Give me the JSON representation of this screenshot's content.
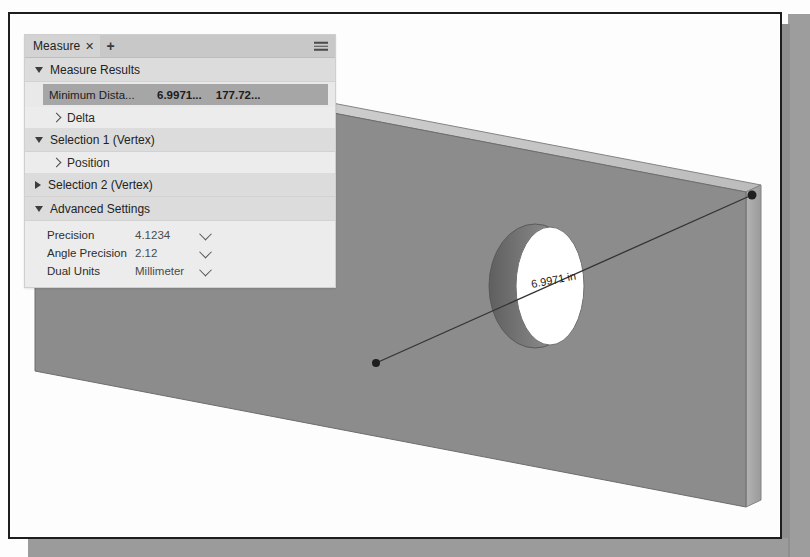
{
  "window": {
    "title": "Measure"
  },
  "panel": {
    "tab": {
      "label": "Measure",
      "close_glyph": "✕",
      "add_glyph": "+",
      "menu_icon": "hamburger-menu-icon"
    },
    "sections": [
      {
        "id": "measure-results",
        "label": "Measure Results",
        "expanded": true,
        "state_glyph": "▼"
      },
      {
        "id": "selection-1",
        "label": "Selection 1 (Vertex)",
        "expanded": true,
        "state_glyph": "▼"
      },
      {
        "id": "selection-2",
        "label": "Selection 2 (Vertex)",
        "expanded": false,
        "state_glyph": "▶"
      },
      {
        "id": "advanced-settings",
        "label": "Advanced Settings",
        "expanded": true,
        "state_glyph": "▼"
      }
    ],
    "result_row": {
      "name": "Minimum Dista...",
      "value_primary": "6.9971...",
      "value_secondary": "177.72...",
      "selected": true
    },
    "sub_rows": {
      "delta": "Delta",
      "position": "Position"
    },
    "advanced_settings": [
      {
        "label": "Precision",
        "value": "4.1234"
      },
      {
        "label": "Angle Precision",
        "value": "2.12"
      },
      {
        "label": "Dual Units",
        "value": "Millimeter"
      }
    ]
  },
  "model": {
    "dimension_label": "6.9971 in",
    "colors": {
      "face": "#8c8c8c",
      "bevel_top": "#c9c9c9",
      "edge_side": "#a3a3a3",
      "hole_interior": "#ffffff",
      "hole_wall": "#6f6f6f",
      "measure_line": "#333333",
      "outline": "#555555"
    }
  }
}
